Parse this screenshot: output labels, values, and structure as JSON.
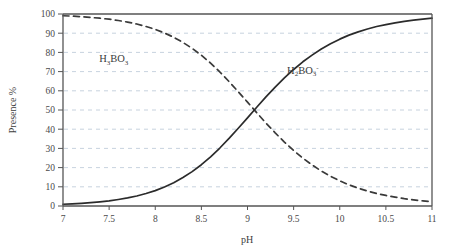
{
  "chart_data": {
    "type": "line",
    "title": "",
    "subtitle": "",
    "xlabel": "pH",
    "ylabel": "Presence %",
    "xlim": [
      7,
      11
    ],
    "ylim": [
      0,
      100
    ],
    "xticks": [
      "7",
      "7.5",
      "8",
      "8.5",
      "9",
      "9.5",
      "10",
      "10.5",
      "11"
    ],
    "xtick_values": [
      7,
      7.5,
      8,
      8.5,
      9,
      9.5,
      10,
      10.5,
      11
    ],
    "yticks": [
      "0",
      "10",
      "20",
      "30",
      "40",
      "50",
      "60",
      "70",
      "80",
      "90",
      "100"
    ],
    "ytick_values": [
      0,
      10,
      20,
      30,
      40,
      50,
      60,
      70,
      80,
      90,
      100
    ],
    "grid": "horizontal-dashed",
    "grid_color": "#b9c6d6",
    "legend_position": "inline-annotation",
    "x": [
      7,
      7.1,
      7.2,
      7.3,
      7.4,
      7.5,
      7.6,
      7.7,
      7.8,
      7.9,
      8,
      8.1,
      8.2,
      8.3,
      8.4,
      8.5,
      8.6,
      8.7,
      8.8,
      8.9,
      9,
      9.1,
      9.2,
      9.3,
      9.4,
      9.5,
      9.6,
      9.7,
      9.8,
      9.9,
      10,
      10.1,
      10.2,
      10.3,
      10.4,
      10.5,
      10.6,
      10.7,
      10.8,
      10.9,
      11
    ],
    "series": [
      {
        "name": "H3BO3",
        "label_text": "H",
        "label_sub1": "3",
        "label_mid": "BO",
        "label_sub2": "3",
        "label_sup": "",
        "style": "dashed",
        "color": "#3a3a3a",
        "annotation_x": 7.55,
        "annotation_y": 75,
        "values": [
          99.1,
          98.9,
          98.6,
          98.2,
          97.8,
          97.3,
          96.6,
          95.8,
          94.8,
          93.5,
          92.0,
          90.1,
          87.9,
          85.2,
          82.1,
          78.5,
          74.4,
          69.8,
          64.8,
          59.5,
          54.1,
          48.6,
          43.2,
          38.1,
          33.3,
          28.9,
          24.9,
          21.4,
          18.2,
          15.5,
          13.1,
          11.0,
          9.3,
          7.8,
          6.5,
          5.5,
          4.6,
          3.8,
          3.2,
          2.7,
          2.2
        ]
      },
      {
        "name": "H2BO3-",
        "label_text": "H",
        "label_sub1": "2",
        "label_mid": "BO",
        "label_sub2": "3",
        "label_sup": "-",
        "style": "solid",
        "color": "#2b2b2b",
        "annotation_x": 9.6,
        "annotation_y": 69,
        "values": [
          0.9,
          1.1,
          1.4,
          1.8,
          2.2,
          2.7,
          3.4,
          4.2,
          5.2,
          6.5,
          8.0,
          9.9,
          12.1,
          14.8,
          17.9,
          21.5,
          25.6,
          30.2,
          35.2,
          40.5,
          45.9,
          51.4,
          56.8,
          61.9,
          66.7,
          71.1,
          75.1,
          78.6,
          81.8,
          84.5,
          86.9,
          89.0,
          90.7,
          92.2,
          93.5,
          94.5,
          95.4,
          96.2,
          96.8,
          97.3,
          97.8
        ]
      }
    ]
  },
  "figure": {
    "background_color": "#ffffff",
    "axis_color": "#555555",
    "plot_frame": "full-box"
  }
}
